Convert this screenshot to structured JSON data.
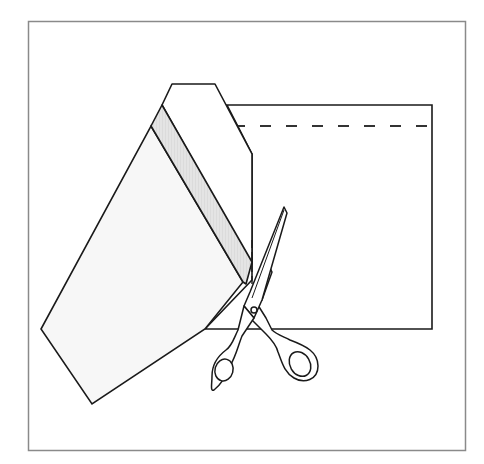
{
  "figure": {
    "title": "Cutting folded paper with scissors",
    "description": "Line illustration: a sheet of paper with a dashed fold line at the top; its left portion is folded diagonally over, with a shaded strip, and a pair of scissors cuts along the fold edge.",
    "colors": {
      "background": "#ffffff",
      "frame": "#8a8a8a",
      "outline": "#1a1a1a",
      "paper_fill": "#f7f7f7",
      "strip_fill": "#e0e0e0",
      "scissors_fill": "#ffffff"
    },
    "elements": {
      "frame_label": "frame",
      "sheet_label": "paper sheet",
      "fold_line_label": "dashed fold line",
      "folded_flap_label": "folded flap",
      "strip_label": "shaded strip",
      "scissors_label": "scissors"
    }
  }
}
